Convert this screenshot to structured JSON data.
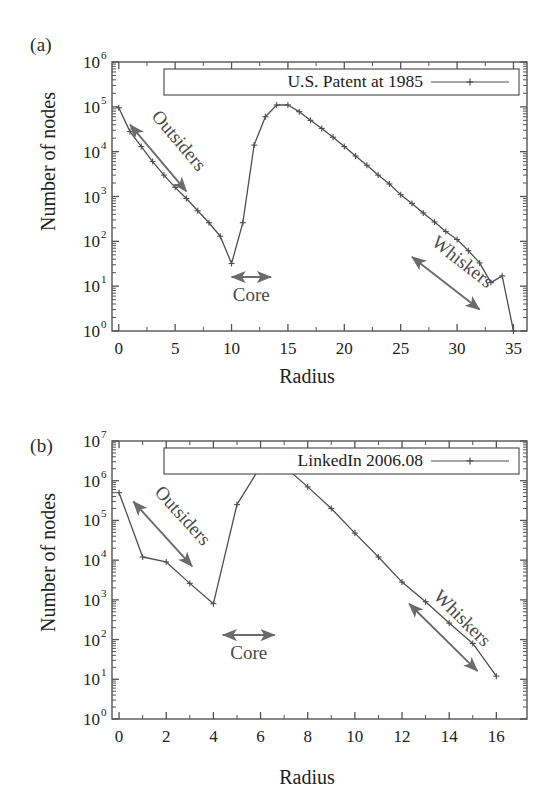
{
  "figure": {
    "panels": [
      {
        "tag": "(a)",
        "legend_label": "U.S. Patent at 1985",
        "xlabel": "Radius",
        "ylabel": "Number of nodes",
        "annotations": {
          "outsiders": "Outsiders",
          "core": "Core",
          "whiskers": "Whiskers"
        },
        "xticks": [
          "0",
          "5",
          "10",
          "15",
          "20",
          "25",
          "30",
          "35"
        ],
        "yticks": [
          "10^0",
          "10^1",
          "10^2",
          "10^3",
          "10^4",
          "10^5",
          "10^6"
        ],
        "ytick_bases": [
          "10",
          "10",
          "10",
          "10",
          "10",
          "10",
          "10"
        ],
        "ytick_exps": [
          "0",
          "1",
          "2",
          "3",
          "4",
          "5",
          "6"
        ]
      },
      {
        "tag": "(b)",
        "legend_label": "LinkedIn 2006.08",
        "xlabel": "Radius",
        "ylabel": "Number of nodes",
        "annotations": {
          "outsiders": "Outsiders",
          "core": "Core",
          "whiskers": "Whiskers"
        },
        "xticks": [
          "0",
          "2",
          "4",
          "6",
          "8",
          "10",
          "12",
          "14",
          "16"
        ],
        "yticks": [
          "10^0",
          "10^1",
          "10^2",
          "10^3",
          "10^4",
          "10^5",
          "10^6",
          "10^7"
        ],
        "ytick_bases": [
          "10",
          "10",
          "10",
          "10",
          "10",
          "10",
          "10",
          "10"
        ],
        "ytick_exps": [
          "0",
          "1",
          "2",
          "3",
          "4",
          "5",
          "6",
          "7"
        ]
      }
    ]
  },
  "chart_data": [
    {
      "type": "line",
      "title": "U.S. Patent at 1985",
      "panel": "(a)",
      "xlabel": "Radius",
      "ylabel": "Number of nodes",
      "yscale": "log",
      "xlim": [
        -0.6,
        36.2
      ],
      "ylim": [
        1,
        1000000
      ],
      "grid": false,
      "legend_position": "top-center-inside",
      "marker": "plus",
      "line_color": "#595959",
      "series": [
        {
          "name": "U.S. Patent at 1985",
          "x": [
            0,
            1,
            2,
            3,
            4,
            5,
            6,
            7,
            8,
            9,
            10,
            11,
            12,
            13,
            14,
            15,
            16,
            17,
            18,
            19,
            20,
            21,
            22,
            23,
            24,
            25,
            26,
            27,
            28,
            29,
            30,
            31,
            32,
            33,
            34,
            35
          ],
          "values": [
            95000,
            28000,
            13000,
            6000,
            3000,
            1600,
            900,
            480,
            260,
            130,
            32,
            260,
            14000,
            60000,
            110000,
            110000,
            78000,
            50000,
            33000,
            21000,
            13000,
            8000,
            5000,
            3000,
            1900,
            1100,
            700,
            430,
            270,
            165,
            110,
            62,
            33,
            12,
            17,
            1
          ]
        }
      ],
      "annotations": [
        {
          "text": "Outsiders",
          "type": "double-arrow",
          "from_x": 1.0,
          "from_y": 40000,
          "to_x": 6.0,
          "to_y": 1300
        },
        {
          "text": "Core",
          "type": "double-arrow",
          "from_x": 10.0,
          "from_y": 16,
          "to_x": 13.5,
          "to_y": 16
        },
        {
          "text": "Whiskers",
          "type": "double-arrow",
          "from_x": 26.0,
          "from_y": 45,
          "to_x": 32.0,
          "to_y": 3
        }
      ]
    },
    {
      "type": "line",
      "title": "LinkedIn 2006.08",
      "panel": "(b)",
      "xlabel": "Radius",
      "ylabel": "Number of nodes",
      "yscale": "log",
      "xlim": [
        -0.3,
        17.3
      ],
      "ylim": [
        1,
        10000000
      ],
      "grid": false,
      "legend_position": "top-center-inside",
      "marker": "plus",
      "line_color": "#595959",
      "series": [
        {
          "name": "LinkedIn 2006.08",
          "x": [
            0,
            1,
            2,
            3,
            4,
            5,
            6,
            7,
            8,
            9,
            10,
            11,
            12,
            13,
            14,
            15,
            16
          ],
          "values": [
            500000,
            12000,
            9000,
            2600,
            800,
            250000,
            2300000,
            2300000,
            700000,
            200000,
            48000,
            12000,
            2800,
            900,
            260,
            80,
            12
          ]
        }
      ],
      "annotations": [
        {
          "text": "Outsiders",
          "type": "double-arrow",
          "from_x": 0.6,
          "from_y": 300000,
          "to_x": 3.1,
          "to_y": 7000
        },
        {
          "text": "Core",
          "type": "double-arrow",
          "from_x": 4.4,
          "from_y": 130,
          "to_x": 6.6,
          "to_y": 130
        },
        {
          "text": "Whiskers",
          "type": "double-arrow",
          "from_x": 12.3,
          "from_y": 800,
          "to_x": 15.2,
          "to_y": 16
        }
      ]
    }
  ]
}
